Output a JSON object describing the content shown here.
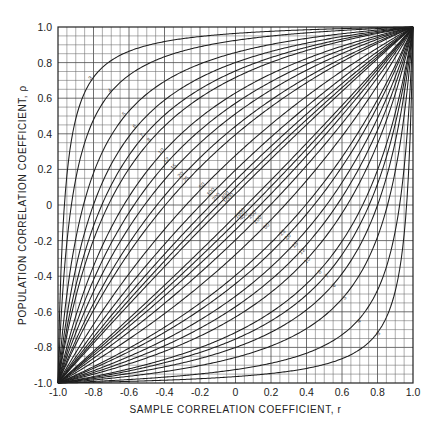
{
  "chart_data": {
    "type": "line",
    "title": "",
    "xlabel": "SAMPLE CORRELATION COEFFICIENT, r",
    "ylabel": "POPULATION CORRELATION COEFFICIENT, ρ",
    "xlim": [
      -1.0,
      1.0
    ],
    "ylim": [
      -1.0,
      1.0
    ],
    "grid": true,
    "grid_step": 0.05,
    "x_ticks": [
      -1.0,
      -0.8,
      -0.6,
      -0.4,
      -0.2,
      0,
      0.2,
      0.4,
      0.6,
      0.8,
      1.0
    ],
    "x_tick_labels": [
      "-1.0",
      "-0.8",
      "-0.6",
      "-0.4",
      "-0.2",
      "0",
      "0.2",
      "0.4",
      "0.6",
      "0.8",
      "1.0"
    ],
    "y_ticks": [
      1.0,
      0.8,
      0.6,
      0.4,
      0.2,
      0,
      -0.2,
      -0.4,
      -0.6,
      -0.8,
      -1.0
    ],
    "y_tick_labels": [
      "1.0",
      "0.8",
      "0.6",
      "0.4",
      "0.2",
      "0",
      "-0.2",
      "-0.4",
      "-0.6",
      "-0.8",
      "-1.0"
    ],
    "legend": "none (curves labeled inline by sample size n)",
    "series": [
      {
        "name": "3",
        "n": 3,
        "z_offset": 2.0,
        "label_r_upper": -0.8
      },
      {
        "name": "4",
        "n": 4,
        "z_offset": 1.62,
        "label_r_upper": -0.69
      },
      {
        "name": "5",
        "n": 5,
        "z_offset": 1.28,
        "label_r_upper": -0.61
      },
      {
        "name": "6",
        "n": 6,
        "z_offset": 1.1,
        "label_r_upper": -0.55
      },
      {
        "name": "7",
        "n": 7,
        "z_offset": 0.98,
        "label_r_upper": -0.51
      },
      {
        "name": "8",
        "n": 8,
        "z_offset": 0.9,
        "label_r_upper": -0.47
      },
      {
        "name": "10",
        "n": 10,
        "z_offset": 0.74,
        "label_r_upper": -0.4
      },
      {
        "name": "12",
        "n": 12,
        "z_offset": 0.65,
        "label_r_upper": -0.37
      },
      {
        "name": "15",
        "n": 15,
        "z_offset": 0.566,
        "label_r_upper": -0.33
      },
      {
        "name": "20",
        "n": 20,
        "z_offset": 0.475,
        "label_r_upper": -0.29
      },
      {
        "name": "25",
        "n": 25,
        "z_offset": 0.418,
        "label_r_upper": -0.26
      },
      {
        "name": "50",
        "n": 50,
        "z_offset": 0.286,
        "label_r_upper": -0.17
      },
      {
        "name": "100",
        "n": 100,
        "z_offset": 0.199,
        "label_r_upper": -0.12
      },
      {
        "name": "200",
        "n": 200,
        "z_offset": 0.14,
        "label_r_upper": -0.09
      },
      {
        "name": "400",
        "n": 400,
        "z_offset": 0.098,
        "label_r_upper": -0.04
      },
      {
        "name": "1000",
        "n": 1000,
        "z_offset": 0.062,
        "label_r_upper": -0.02
      }
    ],
    "sample_points": {
      "3_upper": [
        [
          -0.8,
          0.78
        ],
        [
          -0.2,
          0.9
        ],
        [
          0,
          0.91
        ]
      ],
      "4_upper": [
        [
          -0.69,
          0.65
        ]
      ],
      "5_upper": [
        [
          -0.61,
          0.52
        ]
      ],
      "10_upper": [
        [
          -0.4,
          0.3
        ]
      ],
      "50_upper": [
        [
          -0.17,
          0.09
        ]
      ]
    }
  },
  "axes": {
    "x_title": "SAMPLE CORRELATION COEFFICIENT, r",
    "y_title": "POPULATION CORRELATION COEFFICIENT, ρ"
  }
}
